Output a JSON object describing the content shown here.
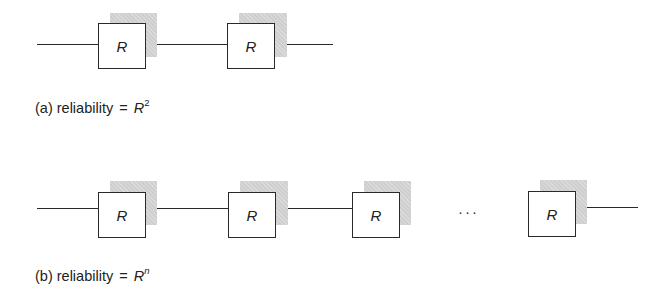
{
  "diagram_a": {
    "blocks": [
      {
        "label": "R"
      },
      {
        "label": "R"
      }
    ],
    "caption": {
      "prefix": "(a) reliability",
      "equals": "=",
      "variable": "R",
      "exponent": "2"
    }
  },
  "diagram_b": {
    "blocks": [
      {
        "label": "R"
      },
      {
        "label": "R"
      },
      {
        "label": "R"
      },
      {
        "label": "R"
      }
    ],
    "ellipsis": "···",
    "caption": {
      "prefix": "(b) reliability",
      "equals": "=",
      "variable": "R",
      "exponent": "n"
    }
  },
  "colors": {
    "line": "#2a2a2a",
    "shadow": "#cfcfcf",
    "background": "#ffffff"
  }
}
